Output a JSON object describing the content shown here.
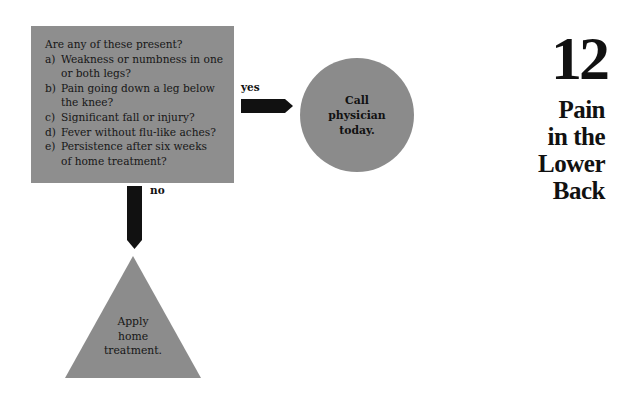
{
  "question_box": {
    "title": "Are any of these present?",
    "items": [
      {
        "letter": "a)",
        "text": "Weakness or numbness in one\nor both legs?"
      },
      {
        "letter": "b)",
        "text": "Pain going down a leg below\nthe knee?"
      },
      {
        "letter": "c)",
        "text": "Significant fall or injury?"
      },
      {
        "letter": "d)",
        "text": "Fever without flu-like aches?"
      },
      {
        "letter": "e)",
        "text": "Persistence after six weeks\nof home treatment?"
      }
    ]
  },
  "branches": {
    "yes_label": "yes",
    "no_label": "no"
  },
  "outcomes": {
    "yes_text": "Call\nphysician\ntoday.",
    "no_text": "Apply\nhome\ntreatment."
  },
  "chapter": {
    "number": "12",
    "title": "Pain\nin the\nLower\nBack"
  },
  "colors": {
    "shape_gray": "#8c8c8c",
    "arrow": "#111111"
  }
}
